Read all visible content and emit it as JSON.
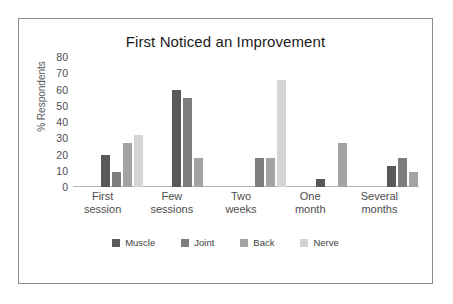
{
  "chart_data": {
    "type": "bar",
    "title": "First Noticed an Improvement",
    "xlabel": "",
    "ylabel": "% Respondents",
    "ylim": [
      0,
      80
    ],
    "yticks": [
      80,
      70,
      60,
      50,
      40,
      30,
      20,
      10,
      0
    ],
    "grid": false,
    "legend_position": "bottom",
    "categories": [
      "First session",
      "Few sessions",
      "Two weeks",
      "One month",
      "Several months"
    ],
    "category_lines": [
      [
        "First",
        "session"
      ],
      [
        "Few",
        "sessions"
      ],
      [
        "Two",
        "weeks"
      ],
      [
        "One",
        "month"
      ],
      [
        "Several",
        "months"
      ]
    ],
    "series": [
      {
        "name": "Muscle",
        "color": "#595959",
        "values": [
          20,
          60,
          0,
          5,
          13
        ]
      },
      {
        "name": "Joint",
        "color": "#7d7d7d",
        "values": [
          9,
          55,
          18,
          0,
          18
        ]
      },
      {
        "name": "Back",
        "color": "#a3a3a3",
        "values": [
          27,
          18,
          18,
          27,
          9
        ]
      },
      {
        "name": "Nerve",
        "color": "#d5d5d5",
        "values": [
          32,
          0,
          66,
          0,
          0
        ]
      }
    ]
  },
  "card": {
    "border_color": "#8c8c8c",
    "background": "#ffffff"
  }
}
